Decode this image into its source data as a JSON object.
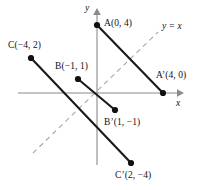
{
  "figure": {
    "axes": {
      "x_label": "x",
      "y_label": "y",
      "origin": {
        "x": 97,
        "y": 93
      },
      "unit_px": 16.5,
      "x_min_px": 18,
      "x_max_px": 180,
      "y_min_px": 165,
      "y_max_px": 12
    },
    "mirror_line": {
      "label": "y = x",
      "label_x": 162,
      "label_y": 22,
      "x1": 33,
      "y1": 153,
      "x2": 158,
      "y2": 32,
      "style": "dashed",
      "color": "#a8a8a8"
    },
    "points": [
      {
        "name": "A",
        "label": "A(0, 4)",
        "coords": [
          0,
          4
        ],
        "px": 97,
        "py": 25,
        "label_x": 104,
        "label_y": 19
      },
      {
        "name": "B",
        "label": "B(−1, 1)",
        "coords": [
          -1,
          1
        ],
        "px": 78,
        "py": 79,
        "label_x": 55,
        "label_y": 62
      },
      {
        "name": "C",
        "label": "C(−4, 2)",
        "coords": [
          -4,
          2
        ],
        "px": 31,
        "py": 58,
        "label_x": 8,
        "label_y": 41
      },
      {
        "name": "A'",
        "label": "A’(4, 0)",
        "coords": [
          4,
          0
        ],
        "px": 163,
        "py": 93,
        "label_x": 156,
        "label_y": 71
      },
      {
        "name": "B'",
        "label": "B’(1, −1)",
        "coords": [
          1,
          -1
        ],
        "px": 115,
        "py": 110,
        "label_x": 104,
        "label_y": 118
      },
      {
        "name": "C'",
        "label": "C’(2, −4)",
        "coords": [
          2,
          -4
        ],
        "px": 131,
        "py": 163,
        "label_x": 115,
        "label_y": 171
      }
    ],
    "segments": [
      {
        "name": "A-to-A-prime",
        "from": "A",
        "to": "A'",
        "x1": 97,
        "y1": 25,
        "x2": 163,
        "y2": 93
      },
      {
        "name": "B-to-B-prime",
        "from": "B",
        "to": "B'",
        "x1": 78,
        "y1": 79,
        "x2": 115,
        "y2": 110
      },
      {
        "name": "C-to-C-prime",
        "from": "C",
        "to": "C'",
        "x1": 31,
        "y1": 58,
        "x2": 131,
        "y2": 163
      }
    ],
    "colors": {
      "axis": "#8a8a8a",
      "segment": "#1a1a1a",
      "mirror": "#a8a8a8",
      "point": "#111111",
      "background": "#ffffff"
    }
  }
}
